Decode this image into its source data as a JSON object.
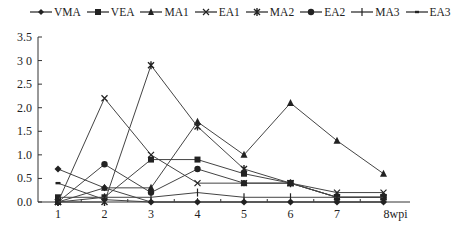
{
  "chart_data": {
    "type": "line",
    "title": "",
    "xlabel": "wpi",
    "ylabel": "",
    "categories": [
      "1",
      "2",
      "3",
      "4",
      "5",
      "6",
      "7",
      "8wpi"
    ],
    "x": [
      1,
      2,
      3,
      4,
      5,
      6,
      7,
      8
    ],
    "ylim": [
      0,
      3.5
    ],
    "yticks": [
      "0.0",
      "0.5",
      "1.0",
      "1.5",
      "2.0",
      "2.5",
      "3.0",
      "3.5"
    ],
    "grid": false,
    "legend_position": "top",
    "series": [
      {
        "name": "VMA",
        "marker": "diamond",
        "values": [
          0.7,
          0.3,
          0.0,
          0.0,
          0.0,
          0.0,
          0.0,
          0.0
        ]
      },
      {
        "name": "VEA",
        "marker": "square",
        "values": [
          0.1,
          0.1,
          0.9,
          0.9,
          0.6,
          0.4,
          0.1,
          0.1
        ]
      },
      {
        "name": "MA1",
        "marker": "triangle",
        "values": [
          0.0,
          0.3,
          0.3,
          1.7,
          1.0,
          2.1,
          1.3,
          0.6
        ]
      },
      {
        "name": "EA1",
        "marker": "x",
        "values": [
          0.0,
          2.2,
          1.0,
          0.4,
          0.4,
          0.4,
          0.2,
          0.2
        ]
      },
      {
        "name": "MA2",
        "marker": "asterisk",
        "values": [
          0.0,
          0.0,
          2.9,
          1.6,
          0.7,
          0.4,
          0.1,
          0.1
        ]
      },
      {
        "name": "EA2",
        "marker": "circle",
        "values": [
          0.0,
          0.8,
          0.2,
          0.7,
          0.4,
          0.4,
          0.1,
          0.1
        ]
      },
      {
        "name": "MA3",
        "marker": "plus",
        "values": [
          0.0,
          0.1,
          0.1,
          0.2,
          0.1,
          0.1,
          0.1,
          0.1
        ]
      },
      {
        "name": "EA3",
        "marker": "dash",
        "values": [
          0.4,
          0.05,
          0.0,
          0.0,
          0.0,
          0.0,
          0.0,
          0.0
        ]
      }
    ]
  },
  "legend": {
    "items": [
      "VMA",
      "VEA",
      "MA1",
      "EA1",
      "MA2",
      "EA2",
      "MA3",
      "EA3"
    ]
  },
  "axes": {
    "x_labels": [
      "1",
      "2",
      "3",
      "4",
      "5",
      "6",
      "7",
      "8wpi"
    ],
    "y_labels": [
      "0.0",
      "0.5",
      "1.0",
      "1.5",
      "2.0",
      "2.5",
      "3 0",
      "3.5"
    ]
  }
}
